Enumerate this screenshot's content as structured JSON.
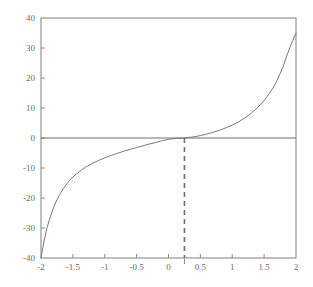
{
  "chart_data": {
    "type": "line",
    "title": "",
    "xlabel": "",
    "ylabel": "",
    "xlim": [
      -2,
      2
    ],
    "ylim": [
      -40,
      40
    ],
    "xticks": [
      -2,
      -1.5,
      -1,
      -0.5,
      0,
      0.5,
      1,
      1.5,
      2
    ],
    "xticklabels": [
      "-2",
      "-1.5",
      "-1",
      "-0.5",
      "0",
      "0.5",
      "1",
      "1.5",
      "2"
    ],
    "yticks": [
      -40,
      -30,
      -20,
      -10,
      0,
      10,
      20,
      30,
      40
    ],
    "yticklabels": [
      "-40",
      "-30",
      "-20",
      "-10",
      "0",
      "10",
      "20",
      "30",
      "40"
    ],
    "grid": false,
    "legend": null,
    "series": [
      {
        "name": "curve",
        "color": "#7a7a7a",
        "style": "solid",
        "x": [
          -2.0,
          -1.95,
          -1.9,
          -1.85,
          -1.8,
          -1.75,
          -1.7,
          -1.65,
          -1.6,
          -1.55,
          -1.5,
          -1.4,
          -1.3,
          -1.2,
          -1.1,
          -1.0,
          -0.9,
          -0.8,
          -0.7,
          -0.6,
          -0.5,
          -0.4,
          -0.3,
          -0.2,
          -0.1,
          0.0,
          0.1,
          0.25,
          0.4,
          0.5,
          0.6,
          0.7,
          0.8,
          0.9,
          1.0,
          1.1,
          1.2,
          1.3,
          1.4,
          1.5,
          1.6,
          1.65,
          1.7,
          1.75,
          1.8,
          1.85,
          1.9,
          1.95,
          2.0
        ],
        "y": [
          -40.0,
          -34.0,
          -29.5,
          -26.0,
          -23.0,
          -20.6,
          -18.6,
          -16.9,
          -15.4,
          -14.1,
          -13.0,
          -11.2,
          -9.7,
          -8.5,
          -7.5,
          -6.6,
          -5.8,
          -5.1,
          -4.4,
          -3.8,
          -3.2,
          -2.6,
          -2.0,
          -1.5,
          -0.9,
          -0.45,
          -0.2,
          0.0,
          0.4,
          0.8,
          1.3,
          1.9,
          2.6,
          3.4,
          4.3,
          5.4,
          6.7,
          8.3,
          10.2,
          12.5,
          15.4,
          17.1,
          19.1,
          21.4,
          24.0,
          27.0,
          30.0,
          32.5,
          35.0
        ]
      }
    ],
    "annotations": [
      {
        "name": "zero-horizontal-line",
        "type": "hline",
        "y": 0,
        "style": "solid",
        "color": "#6e6e6e"
      },
      {
        "name": "root-marker-vertical-dashed-line",
        "type": "vline",
        "x": 0.25,
        "style": "dashed",
        "color": "#6e6e6e",
        "y_from": -40,
        "y_to": 0
      }
    ]
  }
}
